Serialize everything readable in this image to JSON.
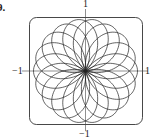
{
  "problem_number": "9.",
  "chart_data": {
    "type": "line",
    "title": "",
    "petals": 18,
    "xlim": [
      -1,
      1
    ],
    "ylim": [
      -1,
      1
    ],
    "tick_labels": {
      "top": "1",
      "bottom": "−1",
      "left": "−1",
      "right": "1"
    },
    "frame": "rounded-square",
    "grid": false
  }
}
